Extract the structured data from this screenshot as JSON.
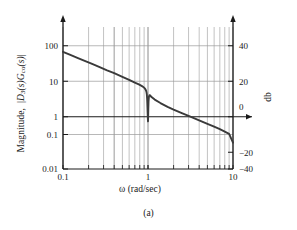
{
  "figure": {
    "caption": "(a)",
    "background_color": "#ffffff"
  },
  "axes": {
    "x": {
      "label_prefix": "ω",
      "label_suffix": " (rad/sec)",
      "label_full": "ω (rad/sec)",
      "ticks": [
        "0.1",
        "1",
        "10"
      ],
      "min": 0.1,
      "max": 10,
      "scale": "log"
    },
    "y_left": {
      "label_full": "Magnitude, |D₃(s)Gᴄₒ(s)|",
      "label_text": "Magnitude,",
      "label_math_d": "D",
      "label_math_d_sub": "3",
      "label_math_s1": "(s)",
      "label_math_g": "G",
      "label_math_g_sub": "co",
      "label_math_s2": "(s)",
      "ticks": [
        "100",
        "10",
        "1",
        "0.1",
        "0.01"
      ],
      "min": 0.01,
      "max": 100,
      "scale": "log"
    },
    "y_right": {
      "label_full": "db",
      "ticks": [
        "40",
        "20",
        "0",
        "−20",
        "−40"
      ],
      "min": -40,
      "max": 40,
      "scale": "linear"
    }
  },
  "style": {
    "curve_color": "#3a3a3a",
    "grid_color": "#9a9a9a",
    "axis_color": "#1a1a1a",
    "zero_db_line_color": "#1a1a1a"
  },
  "chart_data": {
    "type": "line",
    "title": "",
    "subtitle": "",
    "xlabel": "ω (rad/sec)",
    "ylabel": "Magnitude, |D₃(s)Gᴄₒ(s)|",
    "ylabel_right": "db",
    "xscale": "log",
    "yscale": "log",
    "xlim": [
      0.1,
      10
    ],
    "ylim": [
      0.01,
      100
    ],
    "ylim_db": [
      -40,
      40
    ],
    "grid": true,
    "grid_minor": true,
    "legend": "none",
    "annotations": [
      "(a)"
    ],
    "xticks": [
      0.1,
      1,
      10
    ],
    "xticklabels": [
      "0.1",
      "1",
      "10"
    ],
    "yticks": [
      0.01,
      0.1,
      1,
      10,
      100
    ],
    "yticklabels": [
      "0.01",
      "0.1",
      "1",
      "10",
      "100"
    ],
    "yticks_right": [
      -40,
      -20,
      0,
      20,
      40
    ],
    "yticklabels_right": [
      "−40",
      "−20",
      "0",
      "20",
      "40"
    ],
    "series": [
      {
        "name": "|D3(s)Gco(s)|",
        "color": "#3a3a3a",
        "x": [
          0.1,
          0.12,
          0.15,
          0.18,
          0.22,
          0.27,
          0.33,
          0.4,
          0.5,
          0.6,
          0.7,
          0.78,
          0.84,
          0.88,
          0.91,
          0.93,
          0.945,
          0.955,
          0.962,
          0.968,
          0.972,
          0.976,
          0.979,
          0.982,
          0.985,
          0.988,
          0.991,
          0.994,
          0.997,
          1.0,
          1.004,
          1.009,
          1.015,
          1.025,
          1.04,
          1.06,
          1.1,
          1.2,
          1.4,
          1.7,
          2.0,
          2.5,
          3.0,
          4.0,
          5.0,
          6.0,
          7.0,
          8.0,
          9.0,
          10.0
        ],
        "y": [
          20.0,
          16.6,
          13.3,
          11.1,
          9.1,
          7.4,
          6.0,
          5.0,
          3.95,
          3.25,
          2.72,
          2.42,
          2.2,
          2.05,
          1.9,
          1.78,
          1.66,
          1.54,
          1.42,
          1.28,
          1.14,
          0.98,
          0.84,
          0.7,
          0.57,
          0.46,
          0.37,
          0.3,
          0.25,
          0.22,
          0.3,
          0.52,
          0.82,
          1.08,
          1.2,
          1.18,
          1.06,
          0.9,
          0.72,
          0.56,
          0.47,
          0.375,
          0.315,
          0.235,
          0.188,
          0.155,
          0.132,
          0.113,
          0.098,
          0.055
        ]
      }
    ]
  }
}
